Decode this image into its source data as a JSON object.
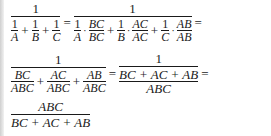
{
  "equation": {
    "line1": {
      "lhs": {
        "numerator": "1",
        "denominator_terms": [
          {
            "num": "1",
            "den": "A"
          },
          {
            "num": "1",
            "den": "B"
          },
          {
            "num": "1",
            "den": "C"
          }
        ]
      },
      "rhs": {
        "numerator": "1",
        "denominator_terms": [
          {
            "a_num": "1",
            "a_den": "A",
            "b_num": "BC",
            "b_den": "BC"
          },
          {
            "a_num": "1",
            "a_den": "B",
            "b_num": "AC",
            "b_den": "AC"
          },
          {
            "a_num": "1",
            "a_den": "C",
            "b_num": "AB",
            "b_den": "AB"
          }
        ]
      },
      "equals": "=",
      "plus": "+",
      "dot": "·",
      "trailing": "="
    },
    "line2": {
      "lhs": {
        "numerator": "1",
        "denominator_terms": [
          {
            "num": "BC",
            "den": "ABC"
          },
          {
            "num": "AC",
            "den": "ABC"
          },
          {
            "num": "AB",
            "den": "ABC"
          }
        ]
      },
      "rhs": {
        "numerator": "1",
        "denominator": {
          "num": "BC + AC + AB",
          "den": "ABC"
        }
      },
      "equals": "=",
      "trailing": "="
    },
    "line3": {
      "numerator": "ABC",
      "denominator": "BC + AC + AB"
    }
  }
}
